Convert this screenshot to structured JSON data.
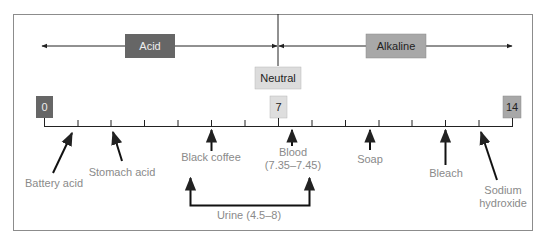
{
  "colors": {
    "frame": "#8c8c8c",
    "line": "#222222",
    "label_text": "#8a8a8a",
    "acid_box": "#666666",
    "acid_text": "#eeeeee",
    "alkaline_box": "#a8a8a8",
    "alkaline_text": "#222222",
    "neutral_box": "#dcdcdc",
    "neutral_text": "#222222",
    "zero_box": "#666666",
    "seven_box": "#dedede",
    "fourteen_box": "#a8a8a8"
  },
  "regions": {
    "acid": "Acid",
    "alkaline": "Alkaline",
    "neutral": "Neutral"
  },
  "scale": {
    "min": 0,
    "max": 14,
    "markers": [
      {
        "value": "0",
        "label": "0"
      },
      {
        "value": "7",
        "label": "7"
      },
      {
        "value": "14",
        "label": "14"
      }
    ]
  },
  "substances": [
    {
      "name": "Battery acid",
      "lines": [
        "Battery acid"
      ],
      "ph": 1
    },
    {
      "name": "Stomach acid",
      "lines": [
        "Stomach acid"
      ],
      "ph": 2
    },
    {
      "name": "Black coffee",
      "lines": [
        "Black coffee"
      ],
      "ph": 5
    },
    {
      "name": "Blood",
      "lines": [
        "Blood",
        "(7.35–7.45)"
      ],
      "ph": 7.4
    },
    {
      "name": "Soap",
      "lines": [
        "Soap"
      ],
      "ph": 10
    },
    {
      "name": "Bleach",
      "lines": [
        "Bleach"
      ],
      "ph": 12
    },
    {
      "name": "Sodium hydroxide",
      "lines": [
        "Sodium",
        "hydroxide"
      ],
      "ph": 13
    }
  ],
  "ranges": [
    {
      "name": "Urine",
      "label": "Urine (4.5–8)",
      "from": 4.5,
      "to": 8
    }
  ],
  "labels": {
    "acid": "Acid",
    "alkaline": "Alkaline",
    "neutral": "Neutral",
    "zero": "0",
    "seven": "7",
    "fourteen": "14",
    "battery_acid": "Battery acid",
    "stomach_acid": "Stomach acid",
    "black_coffee": "Black coffee",
    "blood_1": "Blood",
    "blood_2": "(7.35–7.45)",
    "soap": "Soap",
    "bleach": "Bleach",
    "sodium_1": "Sodium",
    "sodium_2": "hydroxide",
    "urine": "Urine (4.5–8)"
  }
}
